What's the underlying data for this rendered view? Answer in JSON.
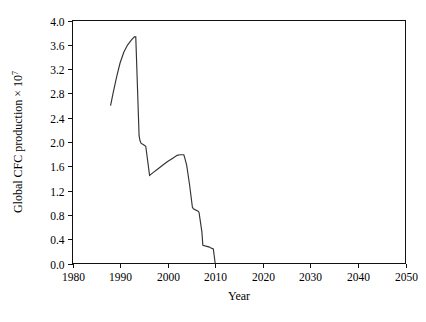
{
  "chart_data": {
    "type": "line",
    "title": "",
    "xlabel": "Year",
    "ylabel": "Global CFC production × 10",
    "ylabel_exponent": "7",
    "xlim": [
      1980,
      2050
    ],
    "ylim": [
      0.0,
      4.0
    ],
    "grid": false,
    "legend": null,
    "xticks": [
      1980,
      1990,
      2000,
      2010,
      2020,
      2030,
      2040,
      2050
    ],
    "xtick_labels": [
      "1980",
      "1990",
      "2000",
      "2010",
      "2020",
      "2030",
      "2040",
      "2050"
    ],
    "yticks": [
      0.0,
      0.4,
      0.8,
      1.2,
      1.6,
      2.0,
      2.4,
      2.8,
      3.2,
      3.6,
      4.0
    ],
    "ytick_labels": [
      "0.0",
      "0.4",
      "0.8",
      "1.2",
      "1.6",
      "2.0",
      "2.4",
      "2.8",
      "3.2",
      "3.6",
      "4.0"
    ],
    "series": [
      {
        "name": "Global CFC production",
        "x": [
          1988.0,
          1988.6,
          1989.3,
          1990.0,
          1990.8,
          1991.6,
          1992.4,
          1993.0,
          1993.3,
          1993.4,
          1994.0,
          1994.2,
          1994.4,
          1995.0,
          1995.4,
          1996.2,
          1997.0,
          1998.0,
          1999.0,
          2000.0,
          2001.0,
          2002.0,
          2002.6,
          2003.4,
          2003.6,
          2004.0,
          2004.6,
          2005.2,
          2005.4,
          2006.4,
          2006.6,
          2007.2,
          2007.4,
          2008.8,
          2009.0,
          2009.6,
          2010.0
        ],
        "y": [
          2.6,
          2.83,
          3.08,
          3.3,
          3.48,
          3.6,
          3.68,
          3.73,
          3.73,
          3.5,
          2.1,
          2.02,
          1.98,
          1.95,
          1.93,
          1.45,
          1.5,
          1.56,
          1.62,
          1.68,
          1.73,
          1.78,
          1.79,
          1.79,
          1.74,
          1.62,
          1.3,
          0.93,
          0.9,
          0.86,
          0.84,
          0.52,
          0.3,
          0.27,
          0.26,
          0.24,
          0.0
        ]
      }
    ]
  }
}
